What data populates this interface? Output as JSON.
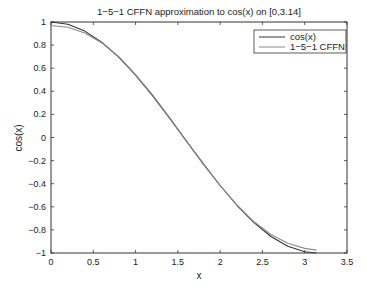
{
  "chart_data": {
    "type": "line",
    "title": "1−5−1 CFFN approximation to cos(x) on [0,3.14]",
    "xlabel": "x",
    "ylabel": "cos(x)",
    "xlim": [
      0,
      3.5
    ],
    "ylim": [
      -1,
      1
    ],
    "grid": false,
    "legend_position": "upper right",
    "x_ticks": [
      0,
      0.5,
      1,
      1.5,
      2,
      2.5,
      3,
      3.5
    ],
    "x_tick_labels": [
      "0",
      "0.5",
      "1",
      "1.5",
      "2",
      "2.5",
      "3",
      "3.5"
    ],
    "y_ticks": [
      -1,
      -0.8,
      -0.6,
      -0.4,
      -0.2,
      0,
      0.2,
      0.4,
      0.6,
      0.8,
      1
    ],
    "y_tick_labels": [
      "−1",
      "−0.8",
      "−0.6",
      "−0.4",
      "−0.2",
      "0",
      "0.2",
      "0.4",
      "0.6",
      "0.8",
      "1"
    ],
    "series": [
      {
        "name": "cos(x)",
        "color": "#333333",
        "x": [
          0,
          0.2,
          0.4,
          0.6,
          0.8,
          1.0,
          1.2,
          1.4,
          1.6,
          1.8,
          2.0,
          2.2,
          2.4,
          2.6,
          2.8,
          3.0,
          3.14
        ],
        "y": [
          1.0,
          0.98,
          0.921,
          0.825,
          0.697,
          0.54,
          0.362,
          0.17,
          -0.029,
          -0.227,
          -0.416,
          -0.589,
          -0.737,
          -0.857,
          -0.942,
          -0.99,
          -1.0
        ]
      },
      {
        "name": "1−5−1 CFFN",
        "color": "#8a8a8a",
        "x": [
          0,
          0.2,
          0.4,
          0.6,
          0.8,
          1.0,
          1.2,
          1.4,
          1.6,
          1.8,
          2.0,
          2.2,
          2.4,
          2.6,
          2.8,
          3.0,
          3.14
        ],
        "y": [
          0.97,
          0.955,
          0.905,
          0.82,
          0.7,
          0.545,
          0.37,
          0.175,
          -0.03,
          -0.23,
          -0.415,
          -0.585,
          -0.73,
          -0.84,
          -0.915,
          -0.96,
          -0.975
        ]
      }
    ]
  },
  "legend": {
    "items": [
      "cos(x)",
      "1−5−1 CFFN"
    ]
  }
}
